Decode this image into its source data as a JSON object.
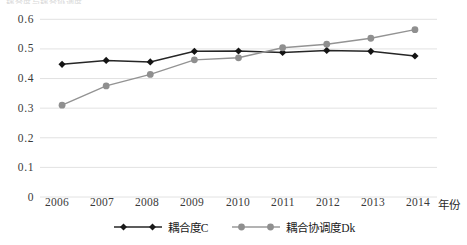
{
  "cropped_header_text": "耦合度与耦合协调度",
  "chart_data": {
    "type": "line",
    "title": "",
    "xlabel": "年份",
    "ylabel": "",
    "categories": [
      "2006",
      "2007",
      "2008",
      "2009",
      "2010",
      "2011",
      "2012",
      "2013",
      "2014"
    ],
    "ylim": [
      0,
      0.6
    ],
    "ytick_labels": [
      "0.6",
      "0.5",
      "0.4",
      "0.3",
      "0.2",
      "0.1",
      "0"
    ],
    "ytick_values": [
      0.6,
      0.5,
      0.4,
      0.3,
      0.2,
      0.1,
      0
    ],
    "grid": true,
    "grid_axis": "y",
    "legend_position": "bottom",
    "series": [
      {
        "name": "耦合度C",
        "color": "#262626",
        "marker": "diamond",
        "values": [
          0.448,
          0.461,
          0.456,
          0.492,
          0.493,
          0.488,
          0.495,
          0.492,
          0.476
        ]
      },
      {
        "name": "耦合协调度Dk",
        "color": "#939393",
        "marker": "circle",
        "values": [
          0.31,
          0.375,
          0.414,
          0.463,
          0.47,
          0.504,
          0.516,
          0.536,
          0.565
        ]
      }
    ]
  },
  "colors": {
    "series_c": "#262626",
    "series_dk": "#939393",
    "grid": "#e2e2e2",
    "text": "#2a2a2a"
  }
}
